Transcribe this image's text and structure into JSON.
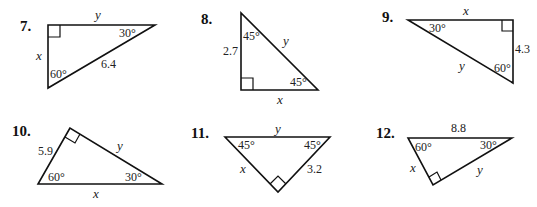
{
  "problems": [
    {
      "number": "7.",
      "labels": {
        "top": "y",
        "left": "x",
        "hyp": "6.4",
        "angle_a": "30°",
        "angle_b": "60°"
      }
    },
    {
      "number": "8.",
      "labels": {
        "left": "2.7",
        "hyp": "y",
        "bottom": "x",
        "angle_a": "45°",
        "angle_b": "45°"
      }
    },
    {
      "number": "9.",
      "labels": {
        "top": "x",
        "right": "4.3",
        "hyp": "y",
        "angle_a": "30°",
        "angle_b": "60°"
      }
    },
    {
      "number": "10.",
      "labels": {
        "left": "5.9",
        "hyp": "y",
        "bottom": "x",
        "angle_a": "60°",
        "angle_b": "30°"
      }
    },
    {
      "number": "11.",
      "labels": {
        "top": "y",
        "left": "x",
        "right": "3.2",
        "angle_a": "45°",
        "angle_b": "45°"
      }
    },
    {
      "number": "12.",
      "labels": {
        "top": "8.8",
        "left": "x",
        "right": "y",
        "angle_a": "60°",
        "angle_b": "30°"
      }
    }
  ]
}
